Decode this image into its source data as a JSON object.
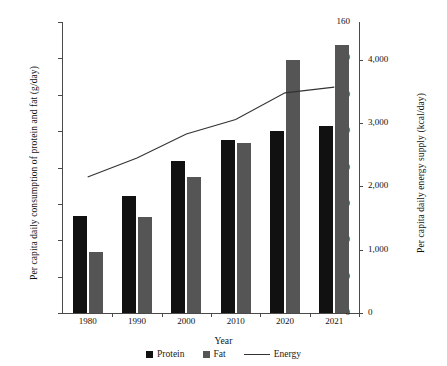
{
  "chart_data": {
    "type": "bar",
    "title": "",
    "xlabel": "Year",
    "ylabel": "Per capita daily consumption of protein and fat (g/day)",
    "y2label": "Per capita daily energy supply (kcal/day)",
    "categories": [
      "1980",
      "1990",
      "2000",
      "2010",
      "2020",
      "2021"
    ],
    "ylim": [
      0,
      160
    ],
    "yticks": [
      "0",
      "20",
      "40",
      "60",
      "80",
      "100",
      "120",
      "140",
      "160"
    ],
    "ytick_values": [
      0,
      20,
      40,
      60,
      80,
      100,
      120,
      140,
      160
    ],
    "y2lim": [
      0,
      4600
    ],
    "y2ticks": [
      "0",
      "1,000",
      "2,000",
      "3,000",
      "4,000"
    ],
    "y2tick_values": [
      0,
      1000,
      2000,
      3000,
      4000
    ],
    "grid": false,
    "legend_position": "bottom",
    "series": [
      {
        "name": "Protein",
        "type": "bar",
        "axis": "left",
        "color": "#111111",
        "values": [
          53.5,
          64.6,
          83.8,
          95.2,
          100.1,
          102.6
        ]
      },
      {
        "name": "Fat",
        "type": "bar",
        "axis": "left",
        "color": "#555555",
        "values": [
          33.4,
          52.7,
          74.7,
          93.3,
          139.2,
          147.2
        ]
      },
      {
        "name": "Energy",
        "type": "line",
        "axis": "right",
        "color": "#333333",
        "values": [
          2150,
          2450,
          2830,
          3060,
          3480,
          3570
        ]
      }
    ]
  },
  "legend": {
    "items": [
      {
        "label": "Protein",
        "marker": "square",
        "color": "#111111"
      },
      {
        "label": "Fat",
        "marker": "square",
        "color": "#555555"
      },
      {
        "label": "Energy",
        "marker": "line",
        "color": "#333333"
      }
    ]
  }
}
